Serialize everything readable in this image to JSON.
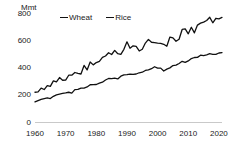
{
  "chart_data": {
    "type": "line",
    "title": "",
    "subtitle": "",
    "unit_label": "Mmt",
    "xlabel": "",
    "ylabel": "Mmt",
    "xlim": [
      1960,
      2021
    ],
    "ylim": [
      0,
      800
    ],
    "yticks": [
      800,
      600,
      400,
      200,
      0
    ],
    "xticks": [
      1960,
      1970,
      1980,
      1990,
      2000,
      2010,
      2020
    ],
    "grid": false,
    "legend_position": "top-center",
    "legend": [
      "Wheat",
      "Rice"
    ],
    "line_color": "#111111",
    "axis_color": "#c9c9c9",
    "x": [
      1960,
      1961,
      1962,
      1963,
      1964,
      1965,
      1966,
      1967,
      1968,
      1969,
      1970,
      1971,
      1972,
      1973,
      1974,
      1975,
      1976,
      1977,
      1978,
      1979,
      1980,
      1981,
      1982,
      1983,
      1984,
      1985,
      1986,
      1987,
      1988,
      1989,
      1990,
      1991,
      1992,
      1993,
      1994,
      1995,
      1996,
      1997,
      1998,
      1999,
      2000,
      2001,
      2002,
      2003,
      2004,
      2005,
      2006,
      2007,
      2008,
      2009,
      2010,
      2011,
      2012,
      2013,
      2014,
      2015,
      2016,
      2017,
      2018,
      2019,
      2020,
      2021
    ],
    "series": [
      {
        "name": "Wheat",
        "values": [
          222,
          225,
          252,
          242,
          271,
          265,
          305,
          298,
          330,
          310,
          311,
          347,
          347,
          367,
          360,
          356,
          419,
          386,
          444,
          423,
          440,
          449,
          478,
          488,
          512,
          499,
          529,
          505,
          500,
          537,
          592,
          545,
          563,
          558,
          525,
          538,
          583,
          610,
          589,
          586,
          583,
          581,
          574,
          560,
          627,
          621,
          596,
          611,
          683,
          687,
          651,
          699,
          658,
          715,
          729,
          737,
          749,
          772,
          732,
          765,
          761,
          771
        ]
      },
      {
        "name": "Rice",
        "values": [
          151,
          161,
          170,
          176,
          180,
          176,
          192,
          203,
          208,
          213,
          217,
          222,
          216,
          241,
          243,
          252,
          253,
          261,
          277,
          278,
          279,
          289,
          296,
          312,
          323,
          322,
          325,
          320,
          340,
          350,
          351,
          355,
          353,
          356,
          365,
          369,
          382,
          386,
          395,
          409,
          399,
          399,
          378,
          392,
          401,
          418,
          421,
          433,
          449,
          441,
          452,
          469,
          477,
          478,
          494,
          491,
          497,
          505,
          500,
          500,
          510,
          513
        ]
      }
    ]
  }
}
